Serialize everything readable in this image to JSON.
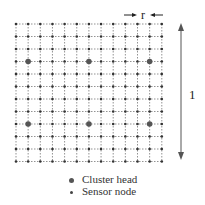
{
  "diagram": {
    "grid": {
      "columns": 13,
      "rows": 12,
      "x0": 16,
      "y0": 24,
      "dx": 12.15,
      "dy": 12.5,
      "line_style": "dotted",
      "line_color": "#777777",
      "node_color": "#333333"
    },
    "cluster_heads": [
      {
        "col": 1,
        "row": 3
      },
      {
        "col": 6,
        "row": 3
      },
      {
        "col": 11,
        "row": 3
      },
      {
        "col": 1,
        "row": 8
      },
      {
        "col": 6,
        "row": 8
      },
      {
        "col": 11,
        "row": 8
      }
    ],
    "spacing_label": "r",
    "side_label": "1"
  },
  "legend": {
    "items": [
      {
        "marker": "cluster-head",
        "label": "Cluster head"
      },
      {
        "marker": "sensor-node",
        "label": "Sensor node"
      }
    ]
  }
}
